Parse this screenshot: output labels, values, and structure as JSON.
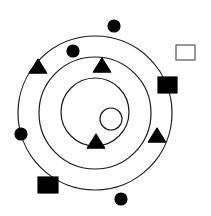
{
  "diagram": {
    "width": 211,
    "height": 216,
    "background": "#ffffff",
    "stroke_color": "#1a1a1a",
    "fill_color": "#000000",
    "rings": [
      {
        "name": "outer-ring",
        "cx": 95,
        "cy": 113,
        "r": 77
      },
      {
        "name": "middle-ring",
        "cx": 95,
        "cy": 113,
        "r": 56
      },
      {
        "name": "inner-ring",
        "cx": 95,
        "cy": 112,
        "r": 34
      }
    ],
    "shapes": [
      {
        "name": "filled-circle-top",
        "type": "circle",
        "filled": true,
        "cx": 114,
        "cy": 26,
        "r": 6
      },
      {
        "name": "filled-circle-upper-left",
        "type": "circle",
        "filled": true,
        "cx": 73,
        "cy": 51,
        "r": 6
      },
      {
        "name": "filled-circle-left",
        "type": "circle",
        "filled": true,
        "cx": 21,
        "cy": 134,
        "r": 6
      },
      {
        "name": "filled-circle-bottom",
        "type": "circle",
        "filled": true,
        "cx": 121,
        "cy": 199,
        "r": 6
      },
      {
        "name": "open-circle-center",
        "type": "circle",
        "filled": false,
        "cx": 111,
        "cy": 119,
        "r": 11
      },
      {
        "name": "filled-triangle-upper-left",
        "type": "triangle",
        "filled": true,
        "cx": 38,
        "cy": 66,
        "size": 18
      },
      {
        "name": "filled-triangle-top",
        "type": "triangle",
        "filled": true,
        "cx": 102,
        "cy": 65,
        "size": 18
      },
      {
        "name": "filled-triangle-inner-bottom",
        "type": "triangle",
        "filled": true,
        "cx": 96,
        "cy": 141,
        "size": 18
      },
      {
        "name": "filled-triangle-right",
        "type": "triangle",
        "filled": true,
        "cx": 157,
        "cy": 135,
        "size": 18
      },
      {
        "name": "filled-square-right",
        "type": "square",
        "filled": true,
        "x": 158,
        "y": 77,
        "w": 19,
        "h": 16
      },
      {
        "name": "filled-square-bottom-left",
        "type": "square",
        "filled": true,
        "x": 38,
        "y": 177,
        "w": 20,
        "h": 16
      },
      {
        "name": "open-square-top-right",
        "type": "square",
        "filled": false,
        "x": 176,
        "y": 45,
        "w": 19,
        "h": 15
      }
    ]
  }
}
